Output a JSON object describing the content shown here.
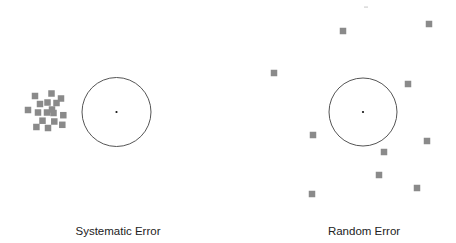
{
  "diagram": {
    "panels": [
      {
        "id": "systematic",
        "label": "Systematic Error",
        "label_x": 118,
        "target": {
          "cx": 116.5,
          "cy": 112,
          "r": 34.5
        },
        "points": [
          [
            35,
            96
          ],
          [
            51.5,
            93.5
          ],
          [
            61,
            98.5
          ],
          [
            40,
            104
          ],
          [
            47.5,
            102.5
          ],
          [
            56.5,
            103
          ],
          [
            28,
            110
          ],
          [
            38,
            112.5
          ],
          [
            47,
            112.5
          ],
          [
            52,
            109.5
          ],
          [
            53.5,
            113
          ],
          [
            63.3,
            115.2
          ],
          [
            42.5,
            120.7
          ],
          [
            54.3,
            121.5
          ],
          [
            36.4,
            127
          ],
          [
            48,
            128
          ],
          [
            62.3,
            124.8
          ]
        ]
      },
      {
        "id": "random",
        "label": "Random Error",
        "label_x": 364,
        "target": {
          "cx": 363,
          "cy": 112,
          "r": 34
        },
        "points": [
          [
            343,
            31
          ],
          [
            429,
            24
          ],
          [
            274,
            73
          ],
          [
            408,
            84
          ],
          [
            313,
            135
          ],
          [
            427,
            141
          ],
          [
            384,
            152
          ],
          [
            379,
            175
          ],
          [
            417,
            188
          ],
          [
            312,
            194
          ]
        ]
      }
    ],
    "style": {
      "point_color": "#8a8a8a",
      "point_size": 6.5,
      "circle_color": "#555555",
      "center_color": "#111111"
    }
  }
}
